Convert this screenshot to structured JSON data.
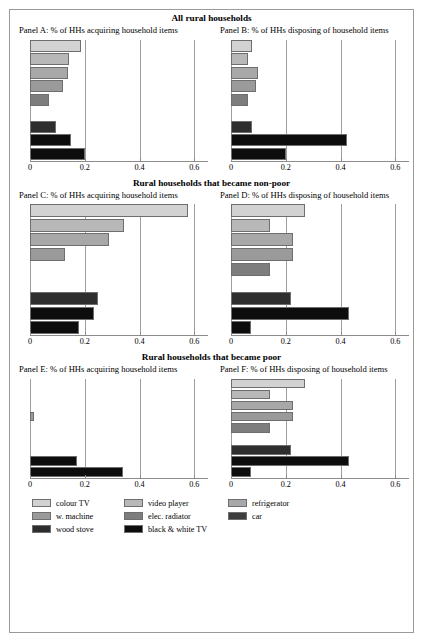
{
  "figure": {
    "x_axis": {
      "ticks": [
        0,
        0.2,
        0.4,
        0.6
      ],
      "tick_labels": [
        "0",
        "0.2",
        "0.4",
        "0.6"
      ],
      "min": 0,
      "max": 0.65
    },
    "legend": {
      "rows": [
        [
          {
            "label": "colour TV",
            "color": "#d2d2d2"
          },
          {
            "label": "video player",
            "color": "#b8b8b8"
          },
          {
            "label": "refrigerator",
            "color": "#a8a8a8"
          }
        ],
        [
          {
            "label": "w. machine",
            "color": "#9a9a9a"
          },
          {
            "label": "elec. radiator",
            "color": "#7d7d7d"
          },
          {
            "label": "car",
            "color": "#3d3d3d"
          }
        ],
        [
          {
            "label": "wood stove",
            "color": "#2e2e2e"
          },
          {
            "label": "black & white TV",
            "color": "#0d0d0d"
          }
        ]
      ]
    },
    "blocks": [
      {
        "title": "All rural households",
        "panels": [
          {
            "head": "Panel A: % of HHs acquiring household items",
            "letter": "A",
            "values": [
              0.185,
              0.142,
              0.138,
              0.122,
              0.068,
              0.0,
              0.095,
              0.148,
              0.202
            ]
          },
          {
            "head": "Panel B: % of HHs disposing of household items",
            "letter": "B",
            "values": [
              0.077,
              0.062,
              0.098,
              0.092,
              0.062,
              0.0,
              0.078,
              0.425,
              0.202
            ]
          }
        ]
      },
      {
        "title": "Rural households that became non-poor",
        "panels": [
          {
            "head": "Panel C: % of HHs acquiring household items",
            "letter": "C",
            "values": [
              0.578,
              0.342,
              0.288,
              0.128,
              0.0,
              0.0,
              0.248,
              0.232,
              0.178
            ]
          },
          {
            "head": "Panel D: % of HHs disposing of household items",
            "letter": "D",
            "values": [
              0.272,
              0.142,
              0.228,
              0.228,
              0.142,
              0.0,
              0.218,
              0.432,
              0.072
            ]
          }
        ]
      },
      {
        "title": "Rural households that became poor",
        "panels": [
          {
            "head": "Panel E: % of HHs acquiring household items",
            "letter": "E",
            "values": [
              0.0,
              0.0,
              0.0,
              0.015,
              0.0,
              0.0,
              0.0,
              0.172,
              0.338
            ]
          },
          {
            "head": "Panel F: % of HHs disposing of household items",
            "letter": "F",
            "values": [
              0.272,
              0.142,
              0.228,
              0.228,
              0.142,
              0.0,
              0.218,
              0.432,
              0.072
            ]
          }
        ]
      }
    ]
  },
  "chart_data": {
    "type": "bar",
    "orientation": "horizontal",
    "xlabel": "",
    "ylabel": "",
    "xlim": [
      0,
      0.65
    ],
    "xticks": [
      0,
      0.2,
      0.4,
      0.6
    ],
    "grid": true,
    "legend_position": "bottom-left",
    "categories": [
      "colour TV",
      "video player",
      "refrigerator",
      "w. machine",
      "elec. radiator",
      "car",
      "wood stove",
      "black & white TV"
    ],
    "colors": [
      "#d2d2d2",
      "#b8b8b8",
      "#a8a8a8",
      "#9a9a9a",
      "#7d7d7d",
      "#3d3d3d",
      "#2e2e2e",
      "#0d0d0d"
    ],
    "panels": [
      {
        "panel": "A",
        "group_title": "All rural households",
        "subtitle": "Panel A: % of HHs acquiring household items",
        "values": [
          0.185,
          0.142,
          0.138,
          0.122,
          0.068,
          0.0,
          0.095,
          0.148,
          0.202
        ]
      },
      {
        "panel": "B",
        "group_title": "All rural households",
        "subtitle": "Panel B: % of HHs disposing of household items",
        "values": [
          0.077,
          0.062,
          0.098,
          0.092,
          0.062,
          0.0,
          0.078,
          0.425,
          0.202
        ]
      },
      {
        "panel": "C",
        "group_title": "Rural households that became non-poor",
        "subtitle": "Panel C: % of HHs acquiring household items",
        "values": [
          0.578,
          0.342,
          0.288,
          0.128,
          0.0,
          0.0,
          0.248,
          0.232,
          0.178
        ]
      },
      {
        "panel": "D",
        "group_title": "Rural households that became non-poor",
        "subtitle": "Panel D: % of HHs disposing of household items",
        "values": [
          0.272,
          0.142,
          0.228,
          0.228,
          0.142,
          0.0,
          0.218,
          0.432,
          0.072
        ]
      },
      {
        "panel": "E",
        "group_title": "Rural households that became poor",
        "subtitle": "Panel E: % of HHs acquiring household items",
        "values": [
          0.0,
          0.0,
          0.0,
          0.015,
          0.0,
          0.0,
          0.0,
          0.172,
          0.338
        ]
      },
      {
        "panel": "F",
        "group_title": "Rural households that became poor",
        "subtitle": "Panel F: % of HHs disposing of household items",
        "values": [
          0.272,
          0.142,
          0.228,
          0.228,
          0.142,
          0.0,
          0.218,
          0.432,
          0.072
        ]
      }
    ]
  }
}
